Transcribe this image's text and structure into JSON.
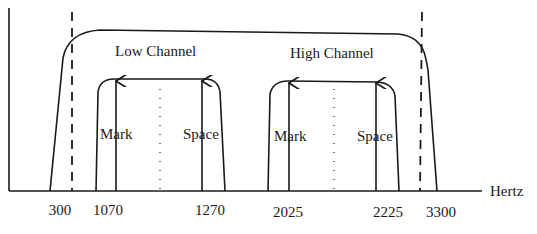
{
  "diagram": {
    "x_axis_label": "Hertz",
    "channels": [
      {
        "label": "Low Channel",
        "mark_label": "Mark",
        "space_label": "Space",
        "mark_hz": 1070,
        "space_hz": 1270
      },
      {
        "label": "High Channel",
        "mark_label": "Mark",
        "space_label": "Space",
        "mark_hz": 2025,
        "space_hz": 2225
      }
    ],
    "passband_limits": [
      300,
      3300
    ],
    "ticks": [
      "300",
      "1070",
      "1270",
      "2025",
      "2225",
      "3300"
    ]
  },
  "colors": {
    "line": "#1a1a1a",
    "background": "#ffffff"
  }
}
